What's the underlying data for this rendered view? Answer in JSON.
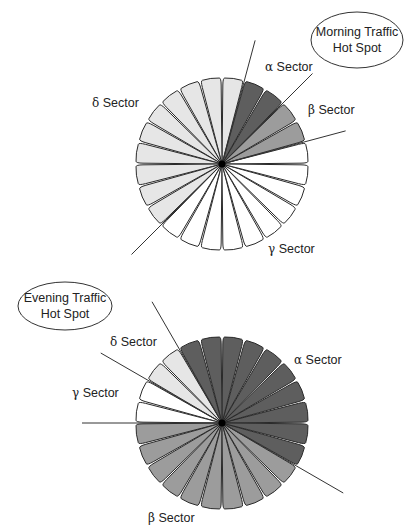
{
  "colors": {
    "dark": "#5e5e5e",
    "medium": "#9c9c9c",
    "light": "#e6e6e6",
    "white": "#ffffff"
  },
  "diagrams": [
    {
      "id": "morning",
      "hotspot_label_line1": "Morning Traffic",
      "hotspot_label_line2": "Hot Spot",
      "petal_count": 24,
      "petal_shades_ccw_from_east": [
        "white",
        "medium",
        "medium",
        "dark",
        "dark",
        "light",
        "light",
        "light",
        "light",
        "light",
        "light",
        "light",
        "light",
        "light",
        "light",
        "white",
        "white",
        "white",
        "white",
        "white",
        "white",
        "white",
        "white",
        "white"
      ],
      "sector_boundaries_deg": [
        15,
        45,
        75,
        225
      ],
      "sectors": [
        {
          "greek": "α",
          "name": "Sector",
          "shade": "dark"
        },
        {
          "greek": "β",
          "name": "Sector",
          "shade": "medium"
        },
        {
          "greek": "γ",
          "name": "Sector",
          "shade": "white"
        },
        {
          "greek": "δ",
          "name": "Sector",
          "shade": "light"
        }
      ]
    },
    {
      "id": "evening",
      "hotspot_label_line1": "Evening Traffic",
      "hotspot_label_line2": "Hot Spot",
      "petal_count": 24,
      "petal_shades_ccw_from_east": [
        "dark",
        "dark",
        "dark",
        "dark",
        "dark",
        "dark",
        "dark",
        "dark",
        "light",
        "light",
        "white",
        "white",
        "medium",
        "medium",
        "medium",
        "medium",
        "medium",
        "medium",
        "medium",
        "medium",
        "medium",
        "medium",
        "dark",
        "dark"
      ],
      "sector_boundaries_deg": [
        120,
        150,
        180,
        330
      ],
      "sectors": [
        {
          "greek": "α",
          "name": "Sector",
          "shade": "dark"
        },
        {
          "greek": "β",
          "name": "Sector",
          "shade": "medium"
        },
        {
          "greek": "γ",
          "name": "Sector",
          "shade": "white"
        },
        {
          "greek": "δ",
          "name": "Sector",
          "shade": "light"
        }
      ]
    }
  ]
}
